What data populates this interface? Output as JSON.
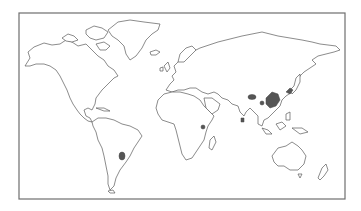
{
  "map": {
    "type": "world outline map",
    "projection": "equirectangular-like",
    "frame": {
      "x": 19,
      "y": 13,
      "width": 326,
      "height": 186
    },
    "colors": {
      "background": "#ffffff",
      "frame_stroke": "#6e6e6e",
      "coastline_stroke": "#5a5a5a",
      "highlight_fill": "#555555"
    },
    "highlighted_regions": [
      {
        "name": "Paraguay / southern Brazil region",
        "cx": 122,
        "cy": 156
      },
      {
        "name": "East Africa (Great Lakes region)",
        "cx": 203,
        "cy": 127
      },
      {
        "name": "Tibet / Himalaya region",
        "cx": 252,
        "cy": 97
      },
      {
        "name": "Southwest China region",
        "cx": 262,
        "cy": 103
      },
      {
        "name": "Central / East China",
        "cx": 272,
        "cy": 98
      },
      {
        "name": "Japan / Korea region",
        "cx": 289,
        "cy": 91
      },
      {
        "name": "Sri Lanka",
        "cx": 242,
        "cy": 120
      }
    ]
  }
}
